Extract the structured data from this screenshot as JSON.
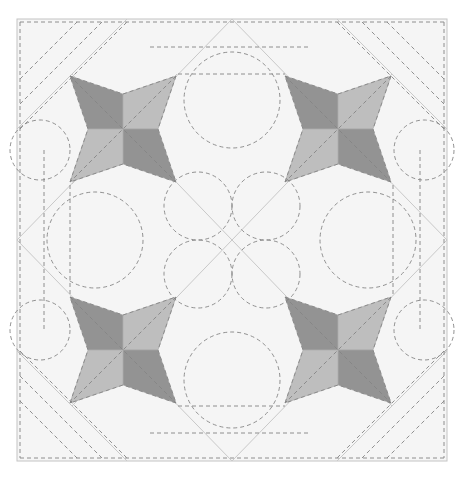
{
  "diagram": {
    "type": "quilt-block",
    "canvas": {
      "width": 464,
      "height": 478,
      "background": "#ffffff"
    },
    "colors": {
      "fabric_background": "#f5f5f5",
      "star_dark": "#939393",
      "star_light": "#bebebe",
      "seam_line": "#c9c9c9",
      "quilting_dash": "#858585"
    },
    "border": {
      "x": 17,
      "y": 19,
      "width": 430,
      "height": 442
    },
    "center": [
      232,
      240
    ],
    "stars": [
      {
        "name": "top-left",
        "cx": 123,
        "cy": 129,
        "tip": 53,
        "indent": 35
      },
      {
        "name": "top-right",
        "cx": 338,
        "cy": 129,
        "tip": 53,
        "indent": 35
      },
      {
        "name": "bottom-left",
        "cx": 123,
        "cy": 350,
        "tip": 53,
        "indent": 35
      },
      {
        "name": "bottom-right",
        "cx": 338,
        "cy": 350,
        "tip": 53,
        "indent": 35
      }
    ],
    "straight_quilting": {
      "horizontal": [
        {
          "y": 22,
          "x1": 20,
          "x2": 444
        },
        {
          "y": 47,
          "x1": 150,
          "x2": 310
        },
        {
          "y": 74,
          "x1": 178,
          "x2": 285
        },
        {
          "y": 406,
          "x1": 178,
          "x2": 285
        },
        {
          "y": 433,
          "x1": 150,
          "x2": 310
        },
        {
          "y": 458,
          "x1": 20,
          "x2": 444
        }
      ],
      "vertical": [
        {
          "x": 20,
          "y1": 22,
          "y2": 458
        },
        {
          "x": 44,
          "y1": 150,
          "y2": 330
        },
        {
          "x": 70,
          "y1": 185,
          "y2": 295
        },
        {
          "x": 393,
          "y1": 185,
          "y2": 295
        },
        {
          "x": 420,
          "y1": 150,
          "y2": 330
        },
        {
          "x": 444,
          "y1": 22,
          "y2": 458
        }
      ]
    },
    "circles": [
      {
        "cx": 232,
        "cy": 100,
        "r": 48
      },
      {
        "cx": 232,
        "cy": 380,
        "r": 48
      },
      {
        "cx": 95,
        "cy": 240,
        "r": 48
      },
      {
        "cx": 368,
        "cy": 240,
        "r": 48
      },
      {
        "cx": 198,
        "cy": 206,
        "r": 34
      },
      {
        "cx": 266,
        "cy": 206,
        "r": 34
      },
      {
        "cx": 198,
        "cy": 274,
        "r": 34
      },
      {
        "cx": 266,
        "cy": 274,
        "r": 34
      },
      {
        "cx": 40,
        "cy": 150,
        "r": 30
      },
      {
        "cx": 424,
        "cy": 150,
        "r": 30
      },
      {
        "cx": 40,
        "cy": 330,
        "r": 30
      },
      {
        "cx": 424,
        "cy": 330,
        "r": 30
      }
    ]
  }
}
